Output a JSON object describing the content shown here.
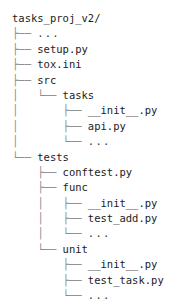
{
  "view": {
    "kind": "directory-tree",
    "root_label": "tasks_proj_v2/",
    "branch_tee": "├── ",
    "branch_end": "└── ",
    "trunk": "│   ",
    "blank": "    ",
    "line_color": "#8a8a8a",
    "text_color": "#1c1c1c",
    "background": "#ffffff"
  },
  "rows": [
    {
      "prefix": "",
      "name": "tasks_proj_v2/",
      "depth": 0,
      "ellipsis": false
    },
    {
      "prefix": "├── ",
      "name": "...",
      "depth": 1,
      "ellipsis": true
    },
    {
      "prefix": "├── ",
      "name": "setup.py",
      "depth": 1,
      "ellipsis": false
    },
    {
      "prefix": "├── ",
      "name": "tox.ini",
      "depth": 1,
      "ellipsis": false
    },
    {
      "prefix": "├── ",
      "name": "src",
      "depth": 1,
      "ellipsis": false
    },
    {
      "prefix": "│   └── ",
      "name": "tasks",
      "depth": 2,
      "ellipsis": false
    },
    {
      "prefix": "│       ├── ",
      "name": "__init__.py",
      "depth": 3,
      "ellipsis": false
    },
    {
      "prefix": "│       ├── ",
      "name": "api.py",
      "depth": 3,
      "ellipsis": false
    },
    {
      "prefix": "│       └── ",
      "name": "...",
      "depth": 3,
      "ellipsis": true
    },
    {
      "prefix": "└── ",
      "name": "tests",
      "depth": 1,
      "ellipsis": false
    },
    {
      "prefix": "    ├── ",
      "name": "conftest.py",
      "depth": 2,
      "ellipsis": false
    },
    {
      "prefix": "    ├── ",
      "name": "func",
      "depth": 2,
      "ellipsis": false
    },
    {
      "prefix": "    │   ├── ",
      "name": "__init__.py",
      "depth": 3,
      "ellipsis": false
    },
    {
      "prefix": "    │   ├── ",
      "name": "test_add.py",
      "depth": 3,
      "ellipsis": false
    },
    {
      "prefix": "    │   └── ",
      "name": "...",
      "depth": 3,
      "ellipsis": true
    },
    {
      "prefix": "    └── ",
      "name": "unit",
      "depth": 2,
      "ellipsis": false
    },
    {
      "prefix": "        ├── ",
      "name": "__init__.py",
      "depth": 3,
      "ellipsis": false
    },
    {
      "prefix": "        ├── ",
      "name": "test_task.py",
      "depth": 3,
      "ellipsis": false
    },
    {
      "prefix": "        └── ",
      "name": "...",
      "depth": 3,
      "ellipsis": true
    }
  ]
}
